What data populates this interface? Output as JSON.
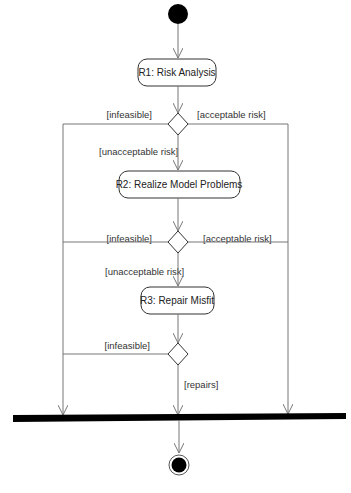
{
  "diagram": {
    "type": "UML activity diagram",
    "colors": {
      "line": "#777777",
      "node_fill": "#000000",
      "box_fill": "#ffffff",
      "box_stroke": "#333333"
    },
    "activities": [
      {
        "id": "r1",
        "label": "R1: Risk Analysis"
      },
      {
        "id": "r2",
        "label": "R2: Realize Model Problems"
      },
      {
        "id": "r3",
        "label": "R3: Repair Misfit"
      }
    ],
    "decisions": [
      {
        "id": "d1",
        "left": "[infeasible]",
        "right": "[acceptable risk]",
        "down": "[unacceptable risk]"
      },
      {
        "id": "d2",
        "left": "[infeasible]",
        "right": "[acceptable risk]",
        "down": "[unacceptable risk]"
      },
      {
        "id": "d3",
        "left": "[infeasible]",
        "down": "[repairs]"
      }
    ],
    "nodes": {
      "initial": "initial-node",
      "join": "join-bar",
      "final": "final-node"
    }
  }
}
